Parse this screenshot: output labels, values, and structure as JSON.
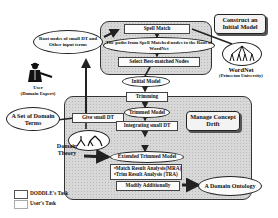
{
  "title_boxes": {
    "construct": "Construct an Initial Model",
    "manage": "Manage Concept Drift"
  },
  "inputs": {
    "root_nodes": "Root nodes of small DT and Other input terms",
    "user": "User",
    "user_role": "(Domain Expert)",
    "domain_terms": "A Set of Domain Terms",
    "domain_theory": "Domain Theory"
  },
  "wordnet": {
    "name": "WordNet",
    "source": "(Princeton University)"
  },
  "construct_steps": {
    "spell_match": "Spell Match",
    "paths": "The paths from Spell Matched nodes to the Root of WordNet",
    "select": "Select Best-matched Nodes"
  },
  "initial_model": "Initial Model",
  "drift_steps": {
    "give_small_dt": "Give small DT",
    "trimming": "Trimming",
    "trimmed_model": "Trimmed Model",
    "integrating": "Integrating small DT",
    "extended": "Extended Trimmed Model",
    "analysis": [
      "•Match Result Analysis(MRA)",
      "•Trim Result Analysis (TRA)"
    ],
    "modify": "Modify Additionally"
  },
  "output": "A Domain Ontology",
  "legend": [
    {
      "label": "DODDLE's Task"
    },
    {
      "label": "User's Task"
    }
  ],
  "colors": {
    "task_fill": "#d8d8d8",
    "box_fill": "#fbfbfb",
    "stroke": "#222222"
  }
}
